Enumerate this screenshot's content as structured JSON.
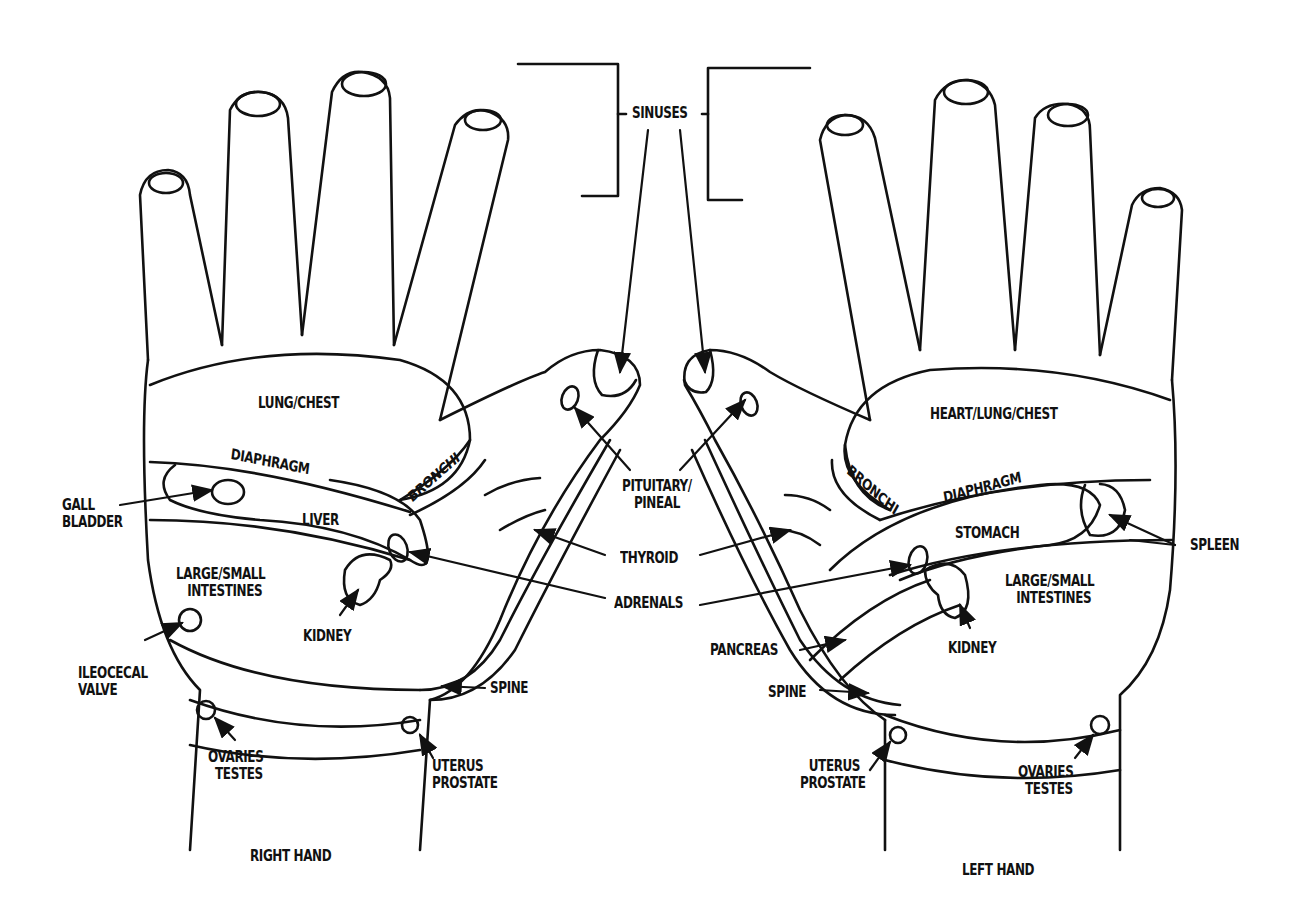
{
  "diagram": {
    "type": "hand reflexology chart",
    "hands": [
      {
        "caption": "RIGHT HAND",
        "zones": [
          "LUNG/CHEST",
          "DIAPHRAGM",
          "BRONCHI",
          "GALL BLADDER",
          "LIVER",
          "LARGE/SMALL INTESTINES",
          "KIDNEY",
          "ILEOCECAL VALVE",
          "OVARIES TESTES",
          "UTERUS PROSTATE",
          "SPINE"
        ]
      },
      {
        "caption": "LEFT HAND",
        "zones": [
          "HEART/LUNG/CHEST",
          "BRONCHI",
          "DIAPHRAGM",
          "STOMACH",
          "SPLEEN",
          "LARGE/SMALL INTESTINES",
          "KIDNEY",
          "PANCREAS",
          "SPINE",
          "UTERUS PROSTATE",
          "OVARIES TESTES"
        ]
      }
    ],
    "shared_labels": [
      "SINUSES",
      "PITUITARY/ PINEAL",
      "THYROID",
      "ADRENALS"
    ]
  },
  "labels": {
    "sinuses": "SINUSES",
    "pituitary_1": "PITUITARY/",
    "pituitary_2": "PINEAL",
    "thyroid": "THYROID",
    "adrenals": "ADRENALS",
    "right": {
      "lung_chest": "LUNG/CHEST",
      "diaphragm": "DIAPHRAGM",
      "bronchi": "BRONCHI",
      "gall_1": "GALL",
      "gall_2": "BLADDER",
      "liver": "LIVER",
      "intestines_1": "LARGE/SMALL",
      "intestines_2": "INTESTINES",
      "kidney": "KIDNEY",
      "ileocecal_1": "ILEOCECAL",
      "ileocecal_2": "VALVE",
      "spine": "SPINE",
      "ovaries_1": "OVARIES",
      "ovaries_2": "TESTES",
      "uterus_1": "UTERUS",
      "uterus_2": "PROSTATE",
      "caption": "RIGHT HAND"
    },
    "left": {
      "heart_lung_chest": "HEART/LUNG/CHEST",
      "bronchi": "BRONCHI",
      "diaphragm": "DIAPHRAGM",
      "stomach": "STOMACH",
      "spleen": "SPLEEN",
      "intestines_1": "LARGE/SMALL",
      "intestines_2": "INTESTINES",
      "kidney": "KIDNEY",
      "pancreas": "PANCREAS",
      "spine": "SPINE",
      "uterus_1": "UTERUS",
      "uterus_2": "PROSTATE",
      "ovaries_1": "OVARIES",
      "ovaries_2": "TESTES",
      "caption": "LEFT HAND"
    }
  }
}
